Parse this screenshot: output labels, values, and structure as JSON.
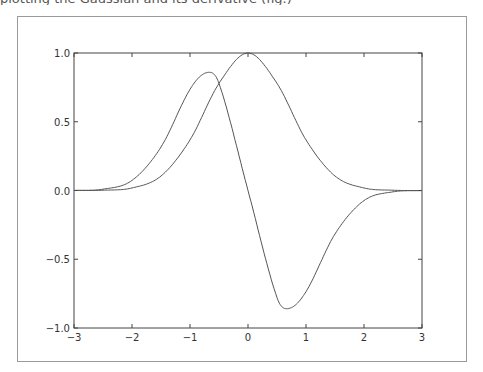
{
  "header": {
    "cutoff_text": "plotting the Gaussian and its derivative (fig.)"
  },
  "chart_data": {
    "type": "line",
    "title": "",
    "xlabel": "",
    "ylabel": "",
    "xlim": [
      -3,
      3
    ],
    "ylim": [
      -1.0,
      1.0
    ],
    "grid": false,
    "legend": null,
    "x_ticks": [
      "−3",
      "−2",
      "−1",
      "0",
      "1",
      "2",
      "3"
    ],
    "y_ticks": [
      "−1.0",
      "−0.5",
      "0.0",
      "0.5",
      "1.0"
    ],
    "series": [
      {
        "name": "exp(-x^2)",
        "color": "#555555",
        "x": [
          -3,
          -2.5,
          -2,
          -1.5,
          -1,
          -0.5,
          0,
          0.5,
          1,
          1.5,
          2,
          2.5,
          3
        ],
        "values": [
          0.0001,
          0.0019,
          0.0183,
          0.1054,
          0.3679,
          0.7788,
          1.0,
          0.7788,
          0.3679,
          0.1054,
          0.0183,
          0.0019,
          0.0001
        ]
      },
      {
        "name": "-2x*exp(-x^2)",
        "color": "#555555",
        "x": [
          -3,
          -2.5,
          -2,
          -1.5,
          -1,
          -0.707,
          -0.5,
          0,
          0.5,
          0.707,
          1,
          1.5,
          2,
          2.5,
          3
        ],
        "values": [
          0.0007,
          0.0097,
          0.0733,
          0.3162,
          0.7358,
          0.8578,
          0.7788,
          0.0,
          -0.7788,
          -0.8578,
          -0.7358,
          -0.3162,
          -0.0733,
          -0.0097,
          -0.0007
        ]
      }
    ]
  }
}
